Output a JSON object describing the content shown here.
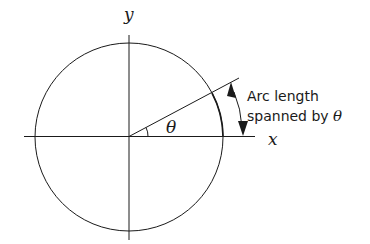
{
  "diagram": {
    "axes": {
      "x_label": "x",
      "y_label": "y"
    },
    "angle_label": "θ",
    "annotation": {
      "line1": "Arc length",
      "line2": "spanned by ",
      "line2_symbol": "θ"
    },
    "colors": {
      "stroke": "#1a1a1a",
      "background": "#ffffff"
    }
  }
}
